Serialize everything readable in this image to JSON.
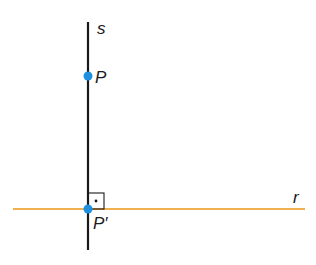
{
  "diagram": {
    "lines": [
      {
        "name": "s",
        "label": "s",
        "color": "#1a1a1a",
        "orientation": "vertical"
      },
      {
        "name": "r",
        "label": "r",
        "color": "#f0a830",
        "orientation": "horizontal"
      }
    ],
    "points": [
      {
        "name": "P",
        "label": "P",
        "color": "#1e90e0"
      },
      {
        "name": "P'",
        "label": "P′",
        "color": "#1e90e0"
      }
    ],
    "right_angle_marker": {
      "symbol": "·"
    }
  }
}
